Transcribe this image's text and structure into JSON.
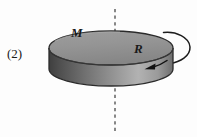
{
  "figure": {
    "item_number": "(2)",
    "mass_label": "M",
    "radius_label": "R",
    "caption_alt": "Uniform disk of mass M and radius R rotating about a vertical dashed axis through its center",
    "colors": {
      "background": "#fdfdfd",
      "top_face_light": "#a8a8a8",
      "top_face_dark": "#8a8a8a",
      "side_face_dark": "#4f4f4f",
      "side_face_light": "#b4b4b4",
      "outline": "#2b2b2b",
      "axis_dash": "#3a3a3a",
      "arrow": "#111111",
      "text": "#1a1a1a"
    },
    "geometry": {
      "disk_center_x": 111,
      "disk_top_center_y": 48,
      "disk_radius_x": 62,
      "disk_radius_y": 17,
      "disk_thickness": 21,
      "axis_x": 115,
      "axis_top_y": 9,
      "axis_bottom_y": 131
    },
    "elements": [
      {
        "name": "item-number-label",
        "text": "(2)"
      },
      {
        "name": "mass-label",
        "text": "M"
      },
      {
        "name": "radius-label",
        "text": "R"
      },
      {
        "name": "rotation-axis",
        "text": ""
      },
      {
        "name": "spin-arrow",
        "text": ""
      },
      {
        "name": "rim-direction-arrow",
        "text": ""
      }
    ]
  }
}
